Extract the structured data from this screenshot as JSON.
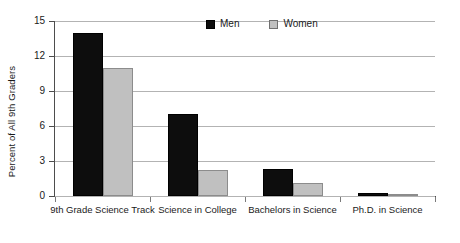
{
  "chart_data": {
    "type": "bar",
    "title": "",
    "xlabel": "",
    "ylabel": "Percent of All 9th Graders",
    "ylim": [
      0,
      15
    ],
    "yticks": [
      0,
      3,
      6,
      9,
      12,
      15
    ],
    "grid": true,
    "legend_position": "top-center",
    "categories": [
      "9th Grade Science Track",
      "Science in College",
      "Bachelors in Science",
      "Ph.D. in Science"
    ],
    "series": [
      {
        "name": "Men",
        "color": "#0d0d0d",
        "values": [
          14.0,
          7.0,
          2.3,
          0.3
        ]
      },
      {
        "name": "Women",
        "color": "#c0c0c0",
        "values": [
          11.0,
          2.2,
          1.1,
          0.1
        ]
      }
    ]
  },
  "axis": {
    "y_title": "Percent of All 9th Graders",
    "y_tick_labels": [
      "15",
      "12",
      "9",
      "6",
      "3",
      "0"
    ],
    "x_tick_labels": [
      "9th Grade Science Track",
      "Science in College",
      "Bachelors in Science",
      "Ph.D. in Science"
    ]
  },
  "legend": {
    "items": [
      {
        "label": "Men",
        "color": "#0d0d0d"
      },
      {
        "label": "Women",
        "color": "#c0c0c0"
      }
    ]
  }
}
